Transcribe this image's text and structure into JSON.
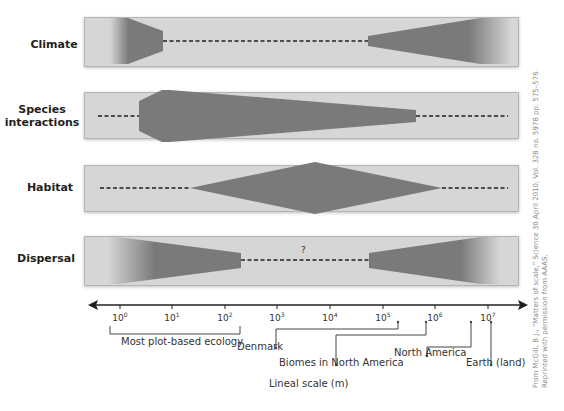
{
  "diagram": {
    "rows": [
      {
        "label": "Climate",
        "id": "climate"
      },
      {
        "label": "Species interactions",
        "label_line1": "Species",
        "label_line2": "interactions",
        "id": "species-interactions"
      },
      {
        "label": "Habitat",
        "id": "habitat"
      },
      {
        "label": "Dispersal",
        "id": "dispersal",
        "unknown_marker": "?"
      }
    ],
    "axis": {
      "ticks": [
        {
          "base": "10",
          "exp": "0"
        },
        {
          "base": "10",
          "exp": "1"
        },
        {
          "base": "10",
          "exp": "2"
        },
        {
          "base": "10",
          "exp": "3"
        },
        {
          "base": "10",
          "exp": "4"
        },
        {
          "base": "10",
          "exp": "5"
        },
        {
          "base": "10",
          "exp": "6"
        },
        {
          "base": "10",
          "exp": "7"
        }
      ],
      "title": "Lineal scale (m)"
    },
    "annotations": {
      "plot_based": "Most plot-based ecology",
      "denmark": "Denmark",
      "biomes": "Biomes in North America",
      "north_america": "North America",
      "earth": "Earth (land)"
    },
    "credit": {
      "line1": "From McGill, B J., “Matters of scale,” Science 30 April 2010, Vol. 328 no. 5978 pp. 575–576.",
      "line2": "Reprinted with permission from AAAS."
    },
    "colors": {
      "band": "#d6d6d6",
      "shape": "#7a7a7a",
      "dash": "#231f20"
    }
  }
}
